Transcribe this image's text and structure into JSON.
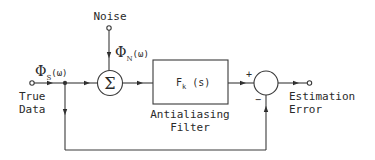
{
  "diagram": {
    "type": "block-diagram",
    "nodes": {
      "noise": {
        "label": "Noise",
        "signal": {
          "symbol": "Φ",
          "subscript": "N",
          "arg": "(ω)"
        }
      },
      "input": {
        "label_line1": "True",
        "label_line2": "Data",
        "signal": {
          "symbol": "Φ",
          "subscript": "S",
          "arg": "(ω)"
        }
      },
      "summer": {
        "symbol": "Σ"
      },
      "filter": {
        "transfer": "F",
        "subscript": "k",
        "arg": "(s)",
        "label_line1": "Antialiasing",
        "label_line2": "Filter"
      },
      "comparator": {
        "plus": "+",
        "minus": "−"
      },
      "output": {
        "label_line1": "Estimation",
        "label_line2": "Error"
      }
    },
    "edges": [
      {
        "from": "input",
        "to": "summer"
      },
      {
        "from": "noise",
        "to": "summer"
      },
      {
        "from": "summer",
        "to": "filter"
      },
      {
        "from": "filter",
        "to": "comparator",
        "sign": "+"
      },
      {
        "from": "input",
        "to": "comparator",
        "sign": "-",
        "route": "feedforward-bottom"
      },
      {
        "from": "comparator",
        "to": "output"
      }
    ],
    "colors": {
      "stroke": "#3a3a3a",
      "text": "#2a2a2a",
      "background": "#ffffff"
    }
  }
}
